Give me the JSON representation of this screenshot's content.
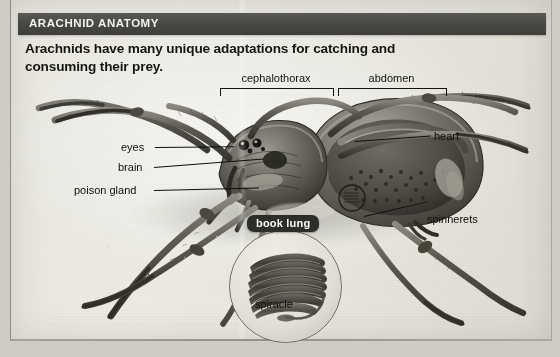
{
  "page": {
    "background_color": "#e9e7e0",
    "edge_color": "#8f8d86"
  },
  "header": {
    "title": "ARACHNID ANATOMY",
    "bar_color": "#4a4845",
    "title_color": "#f2f1ec"
  },
  "headline": {
    "text": "Arachnids have many unique adaptations for catching and consuming their prey.",
    "color": "#17150f"
  },
  "body_regions": [
    {
      "name": "cephalothorax",
      "label": "cephalothorax"
    },
    {
      "name": "abdomen",
      "label": "abdomen"
    }
  ],
  "callouts": {
    "left": [
      {
        "name": "eyes",
        "label": "eyes"
      },
      {
        "name": "brain",
        "label": "brain"
      },
      {
        "name": "poison-gland",
        "label": "poison gland"
      }
    ],
    "right": [
      {
        "name": "heart",
        "label": "heart"
      },
      {
        "name": "spinnerets",
        "label": "spinnerets"
      }
    ]
  },
  "inset": {
    "badge_label": "book lung",
    "badge_background": "#2f2d29",
    "badge_text_color": "#fbfaf6",
    "inner_label": "spiracle",
    "shape": "circle"
  },
  "figure": {
    "style": "grayscale cutaway photograph illustration",
    "leg_count": 8
  }
}
